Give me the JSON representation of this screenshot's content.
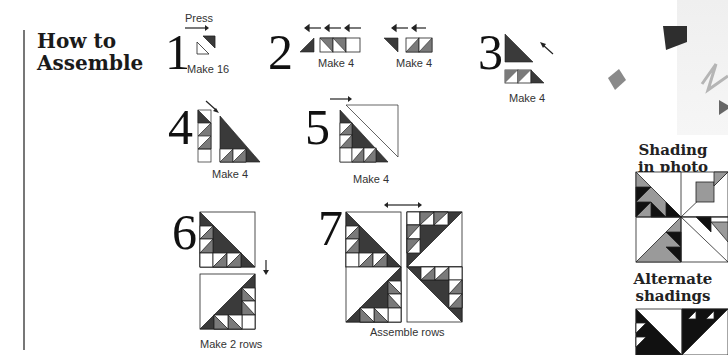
{
  "heading": {
    "line1": "How to",
    "line2": "Assemble"
  },
  "steps": [
    {
      "number": "1",
      "note": "Press",
      "caption": "Make 16"
    },
    {
      "number": "2",
      "caption_a": "Make 4",
      "caption_b": "Make 4"
    },
    {
      "number": "3",
      "caption": "Make 4"
    },
    {
      "number": "4",
      "caption": "Make 4"
    },
    {
      "number": "5",
      "caption": "Make 4"
    },
    {
      "number": "6",
      "caption": "Make 2 rows"
    },
    {
      "number": "7",
      "caption": "Assemble rows"
    }
  ],
  "sidebar": {
    "shading_title_1": "Shading",
    "shading_title_2": "in photo",
    "alternate_title_1": "Alternate",
    "alternate_title_2": "shadings"
  },
  "colors": {
    "dark": "#3a3a3a",
    "medium": "#7a7a7a",
    "light": "#a0a0a0",
    "line": "#222222"
  }
}
